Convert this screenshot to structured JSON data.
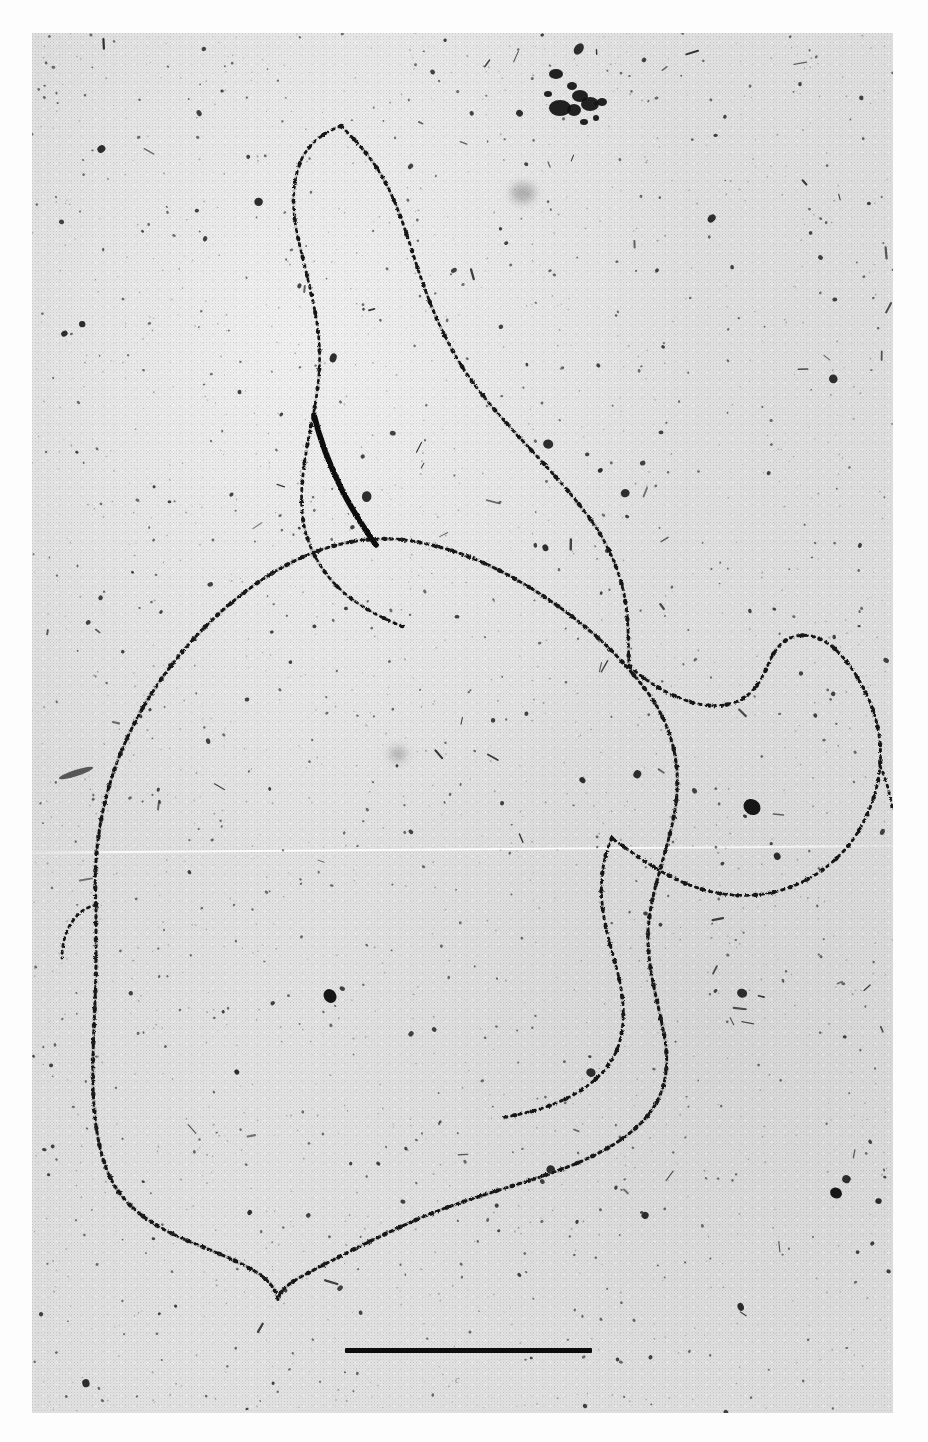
{
  "image": {
    "kind": "electron-micrograph",
    "subject": "circular DNA molecule with a single-stranded tail",
    "technique": "rotary-shadowed / stained nucleic acid spread",
    "plate_background_hex": "#e4e4e4",
    "strand_hex": "#141414",
    "paper_hex": "#fdfdfd",
    "plate": {
      "left": 32,
      "top": 33,
      "width": 861,
      "height": 1380
    }
  },
  "scale_bar": {
    "label": "",
    "x": 345,
    "y": 1348,
    "width": 247,
    "height": 5,
    "color_hex": "#0d0d0d"
  },
  "plate_mark": {
    "text": "c"
  },
  "bleed_text": {
    "text": ""
  },
  "molecule": {
    "loop_label": "circular duplex loop",
    "tail_label": "free trailing strand",
    "branch_label": "branch point",
    "loop_path": "M 96 905 C 92 846, 104 784, 132 728 C 160 672, 203 622, 253 586 C 300 552, 352 534, 404 540 C 452 546, 497 566, 540 594 C 585 623, 620 655, 648 693 C 672 726, 681 764, 676 803 C 670 848, 650 889, 648 932 C 647 970, 659 1004, 665 1040 C 670 1072, 664 1100, 641 1123 C 614 1150, 574 1166, 531 1180 C 487 1194, 446 1206, 409 1223 C 374 1239, 342 1255, 310 1272 C 292 1281, 280 1289, 278 1300 C 276 1288, 266 1277, 251 1269 C 228 1256, 201 1247, 177 1236 C 149 1223, 125 1206, 112 1181 C 98 1154, 94 1120, 93 1086 C 92 1045, 96 1001, 96 960 Z",
    "tail_path": "M 341 126 C 322 133, 307 145, 300 163 C 292 184, 292 209, 297 233 C 304 266, 314 298, 318 331 C 322 362, 318 392, 312 421 C 306 451, 300 481, 302 510 C 304 538, 315 562, 333 582 C 352 603, 379 617, 404 627",
    "branch_path": "M 341 126 C 356 141, 372 158, 383 178 C 397 203, 406 232, 415 260 C 426 295, 440 330, 458 360 C 476 390, 498 414, 520 438 C 544 464, 568 489, 588 516 C 606 540, 618 566, 624 594 C 629 618, 628 642, 629 666",
    "upper_right_path": "M 629 666 C 646 681, 666 694, 688 701 C 706 707, 724 708, 740 700 C 754 693, 762 679, 768 665 C 774 650, 782 639, 797 636 C 812 633, 826 640, 838 652 C 852 666, 862 684, 870 702 C 878 722, 882 744, 880 766 C 878 790, 870 812, 858 832 C 845 853, 827 869, 806 880 C 784 892, 758 897, 732 895 C 708 893, 686 885, 666 874 C 646 863, 628 850, 612 838",
    "lower_right_path": "M 612 838 C 603 857, 600 880, 602 902 C 604 927, 612 950, 618 974 C 624 999, 626 1024, 618 1047 C 610 1069, 592 1085, 571 1096 C 549 1108, 524 1114, 500 1118",
    "left_stub_path": "M 96 905 C 86 907, 78 913, 72 922 C 65 932, 62 945, 62 958",
    "far_right_path": "M 880 766 C 886 779, 890 793, 892 808"
  },
  "features": [
    {
      "name": "debris-cluster-top",
      "x": 578,
      "y": 108,
      "size": 34,
      "label": "stain debris aggregate"
    },
    {
      "name": "grey-blob-upper",
      "x": 523,
      "y": 193,
      "size": 22,
      "label": "out-of-focus particle"
    },
    {
      "name": "dark-speck-mid-left",
      "x": 330,
      "y": 996,
      "size": 13,
      "label": "dense stain grain"
    },
    {
      "name": "dark-speck-right",
      "x": 752,
      "y": 807,
      "size": 16,
      "label": "dense stain grain"
    },
    {
      "name": "grey-blob-center",
      "x": 398,
      "y": 754,
      "size": 15,
      "label": "out-of-focus particle"
    },
    {
      "name": "dark-speck-lower-right",
      "x": 836,
      "y": 1193,
      "size": 11,
      "label": "dense stain grain"
    },
    {
      "name": "dark-streak-left",
      "x": 76,
      "y": 773,
      "size": 18,
      "label": "surface scratch"
    }
  ]
}
